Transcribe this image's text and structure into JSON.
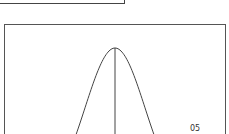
{
  "diagram": {
    "type": "normal-distribution-curve",
    "labels": {
      "tail_probability": "05"
    },
    "colors": {
      "line": "#444444",
      "background": "#ffffff"
    },
    "mean_line": true
  }
}
